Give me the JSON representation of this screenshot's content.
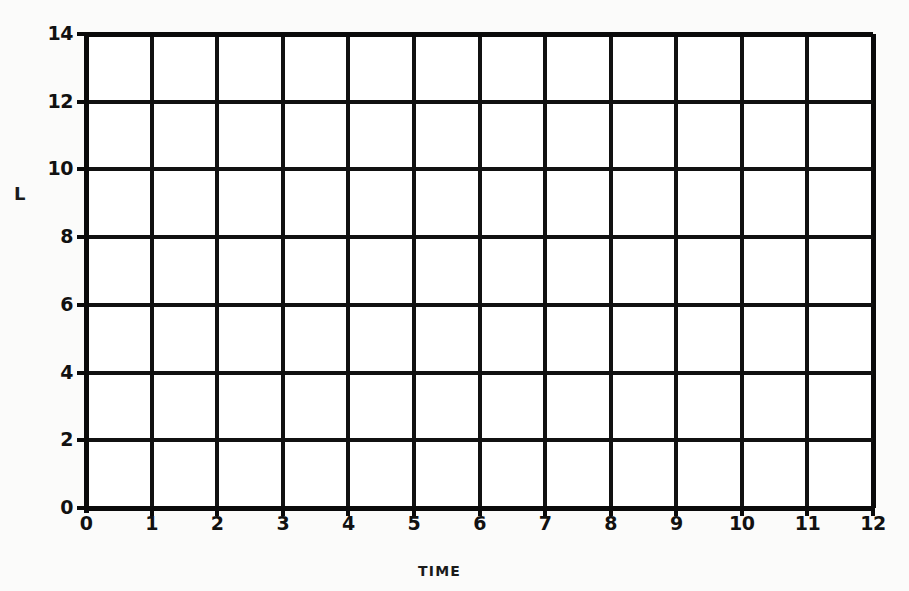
{
  "caption": {
    "clipped_text_remnant": "",
    "note": "top caption row is cut off above image boundary"
  },
  "chart_data": {
    "type": "line",
    "title": "",
    "subtitle": "",
    "xlabel": "TIME",
    "ylabel": "L",
    "xlim": [
      0,
      12
    ],
    "ylim": [
      0,
      14
    ],
    "x_ticks": [
      "0",
      "1",
      "2",
      "3",
      "4",
      "5",
      "6",
      "7",
      "8",
      "9",
      "10",
      "11",
      "12"
    ],
    "y_ticks": [
      "0",
      "2",
      "4",
      "6",
      "8",
      "10",
      "12",
      "14"
    ],
    "x_tick_values": [
      0,
      1,
      2,
      3,
      4,
      5,
      6,
      7,
      8,
      9,
      10,
      11,
      12
    ],
    "y_tick_values": [
      0,
      2,
      4,
      6,
      8,
      10,
      12,
      14
    ],
    "x_major_step": 1,
    "y_major_step": 2,
    "grid": true,
    "grid_axis": "both",
    "legend": null,
    "legend_position": "none",
    "series": [],
    "values": [],
    "annotations": [],
    "colors": {
      "grid_line": "#111111",
      "axis_line": "#0a0a0a",
      "plot_background": "#ffffff",
      "page_background": "#fbfbfa",
      "text": "#111111"
    }
  }
}
